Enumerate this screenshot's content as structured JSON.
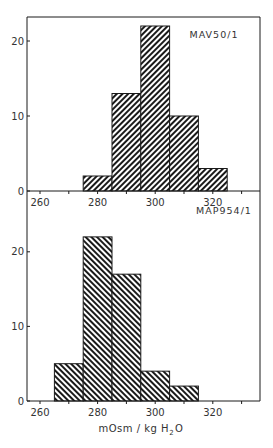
{
  "chart_data": [
    {
      "type": "bar",
      "title": "MAV50/1",
      "panel_label": "MAV50/1",
      "xlabel": "",
      "ylabel": "",
      "bin_edges": [
        275,
        285,
        295,
        305,
        315,
        325
      ],
      "categories": [
        "275-285",
        "285-295",
        "295-305",
        "305-315",
        "315-325"
      ],
      "values": [
        2,
        13,
        22,
        10,
        3
      ],
      "xlim": [
        255,
        336
      ],
      "ylim": [
        0,
        23
      ],
      "xticks": [
        260,
        270,
        280,
        290,
        300,
        310,
        320,
        330
      ],
      "xtick_labels": [
        "260",
        "280",
        "300",
        "320"
      ],
      "yticks": [
        0,
        10,
        20
      ],
      "ytick_labels": [
        "0",
        "10",
        "20"
      ],
      "hatch": "forward-diagonal",
      "grid": false,
      "legend": "none"
    },
    {
      "type": "bar",
      "title": "MAP954/1",
      "panel_label": "MAP954/1",
      "xlabel": "mOsm / kg H2O",
      "ylabel": "",
      "bin_edges": [
        265,
        275,
        285,
        295,
        305,
        315
      ],
      "categories": [
        "265-275",
        "275-285",
        "285-295",
        "295-305",
        "305-315"
      ],
      "values": [
        5,
        22,
        17,
        4,
        2
      ],
      "xlim": [
        255,
        336
      ],
      "ylim": [
        0,
        23
      ],
      "xticks": [
        260,
        270,
        280,
        290,
        300,
        310,
        320,
        330
      ],
      "xtick_labels": [
        "260",
        "280",
        "300",
        "320"
      ],
      "yticks": [
        0,
        10,
        20
      ],
      "ytick_labels": [
        "0",
        "10",
        "20"
      ],
      "hatch": "back-diagonal",
      "grid": false,
      "legend": "none"
    }
  ],
  "labels": {
    "top_panel": "MAV50/1",
    "bottom_panel": "MAP954/1",
    "x_axis_title_main": "mOsm / kg H",
    "x_axis_title_sub": "2",
    "x_axis_title_end": "O"
  },
  "colors": {
    "ink": "#1a1a1a",
    "background": "#ffffff"
  }
}
